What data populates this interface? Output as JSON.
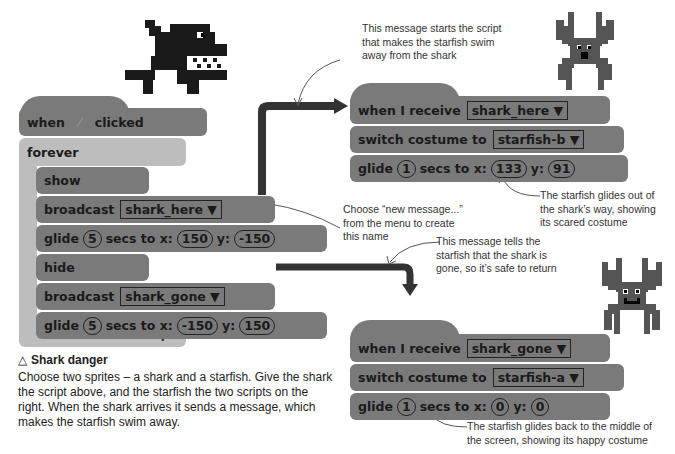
{
  "shark_script": {
    "hat": {
      "when": "when",
      "flag_icon": "green-flag-icon",
      "clicked": "clicked"
    },
    "forever": "forever",
    "show": "show",
    "broadcast1": {
      "label": "broadcast",
      "message": "shark_here ▼"
    },
    "glide1": {
      "label": "glide",
      "secs": "5",
      "secs_label": "secs to x:",
      "x": "150",
      "y_label": "y:",
      "y": "-150"
    },
    "hide": "hide",
    "broadcast2": {
      "label": "broadcast",
      "message": "shark_gone ▼"
    },
    "glide2": {
      "label": "glide",
      "secs": "5",
      "secs_label": "secs to x:",
      "x": "-150",
      "y_label": "y:",
      "y": "150"
    },
    "loop_icon": "↱"
  },
  "starfish_script_1": {
    "receive": {
      "label": "when I receive",
      "message": "shark_here ▼"
    },
    "costume": {
      "label": "switch costume to",
      "value": "starfish-b ▼"
    },
    "glide": {
      "label": "glide",
      "secs": "1",
      "secs_label": "secs to x:",
      "x": "133",
      "y_label": "y:",
      "y": "91"
    }
  },
  "starfish_script_2": {
    "receive": {
      "label": "when I receive",
      "message": "shark_gone ▼"
    },
    "costume": {
      "label": "switch costume to",
      "value": "starfish-a ▼"
    },
    "glide": {
      "label": "glide",
      "secs": "1",
      "secs_label": "secs to x:",
      "x": "0",
      "y_label": "y:",
      "y": "0"
    }
  },
  "annotations": {
    "a1": [
      "This message starts the script",
      "that makes the starfish swim",
      "away from the shark"
    ],
    "a2": [
      "Choose “new message...”",
      "from the menu to create",
      "this name"
    ],
    "a3": [
      "The starfish glides out of",
      "the shark’s way, showing",
      "its scared costume"
    ],
    "a4": [
      "This message tells the",
      "starfish that the shark is",
      "gone, so it’s safe to return"
    ],
    "a5": [
      "The starfish glides back to the middle of",
      "the screen, showing its happy costume"
    ]
  },
  "caption": {
    "icon": "△",
    "title": "Shark danger",
    "lines": [
      "Choose two sprites – a shark and a starfish. Give the shark",
      "the script above, and the starfish the two scripts on the",
      "right. When the shark arrives it sends a message, which",
      "makes the starfish swim away."
    ]
  },
  "colors": {
    "block": "#7a7a7a",
    "control": "#bdbdbd",
    "connector": "#333333"
  }
}
